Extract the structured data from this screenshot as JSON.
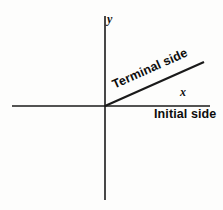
{
  "figure": {
    "width": 223,
    "height": 210,
    "background_color": "#fdfdfc",
    "stroke_color": "#1a1a1a"
  },
  "axes": {
    "origin": {
      "x": 105,
      "y": 106
    },
    "x_axis": {
      "label": "x",
      "x1": 12,
      "y1": 106,
      "x2": 210,
      "y2": 106,
      "stroke_width": 1.6
    },
    "y_axis": {
      "label": "y",
      "x1": 105,
      "y1": 16,
      "x2": 105,
      "y2": 200,
      "stroke_width": 1.6
    }
  },
  "rays": {
    "terminal_side": {
      "label": "Terminal side",
      "x1": 105,
      "y1": 106,
      "x2": 204,
      "y2": 62,
      "angle_degrees": -24,
      "stroke_width": 2.1
    },
    "initial_side": {
      "label": "Initial side",
      "x1": 105,
      "y1": 106,
      "x2": 210,
      "y2": 106,
      "angle_degrees": 0
    }
  },
  "chart_data": {
    "type": "line",
    "xlabel": "x",
    "ylabel": "y",
    "xlim": [
      -93,
      105
    ],
    "ylim": [
      -94,
      90
    ],
    "grid": false,
    "legend": "none",
    "series": [
      {
        "name": "x-axis",
        "x": [
          -93,
          105
        ],
        "y": [
          0,
          0
        ]
      },
      {
        "name": "y-axis",
        "x": [
          0,
          0
        ],
        "y": [
          90,
          -94
        ]
      },
      {
        "name": "Terminal side",
        "x": [
          0,
          99
        ],
        "y": [
          0,
          44
        ]
      }
    ],
    "annotations": [
      {
        "text": "y",
        "x": 5,
        "y": 88,
        "style": "italic"
      },
      {
        "text": "x",
        "x": 78,
        "y": 14,
        "style": "italic"
      },
      {
        "text": "Terminal side",
        "x": 8,
        "y": 22,
        "rotation": -24
      },
      {
        "text": "Initial side",
        "x": 49,
        "y": -9,
        "rotation": 0
      }
    ]
  }
}
